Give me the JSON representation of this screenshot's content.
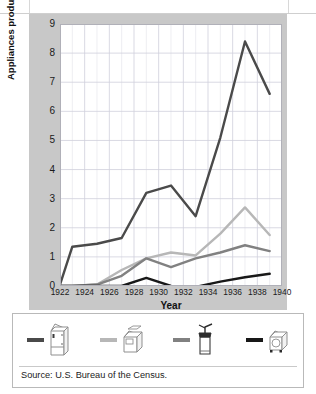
{
  "chart_data": {
    "type": "line",
    "title": "",
    "xlabel": "Year",
    "ylabel": "Appliances produced (in millions)",
    "xlim": [
      1922,
      1940
    ],
    "ylim": [
      0,
      9
    ],
    "xticks": [
      1922,
      1924,
      1926,
      1928,
      1930,
      1932,
      1934,
      1936,
      1938,
      1940
    ],
    "yticks": [
      0,
      1,
      2,
      3,
      4,
      5,
      6,
      7,
      8,
      9
    ],
    "grid": true,
    "legend_position": "bottom",
    "x": [
      1922,
      1923,
      1925,
      1927,
      1929,
      1931,
      1933,
      1935,
      1937,
      1939
    ],
    "series": [
      {
        "name": "refrigerators",
        "icon": "refrigerator-icon",
        "color": "#4a4a4a",
        "values": [
          0.05,
          1.35,
          1.45,
          1.65,
          3.2,
          3.45,
          2.4,
          5.1,
          8.4,
          6.6
        ]
      },
      {
        "name": "washing-machines",
        "icon": "washing-machine-icon",
        "color": "#b7b7b7",
        "values": [
          0.0,
          0.0,
          0.05,
          0.55,
          0.95,
          1.15,
          1.05,
          1.8,
          2.7,
          1.75
        ]
      },
      {
        "name": "vacuum-cleaners",
        "icon": "vacuum-cleaner-icon",
        "color": "#818181",
        "values": [
          0.0,
          0.0,
          0.05,
          0.35,
          0.95,
          0.65,
          0.95,
          1.15,
          1.4,
          1.2
        ]
      },
      {
        "name": "radios",
        "icon": "radio-icon",
        "color": "#181818",
        "values": [
          0.0,
          0.0,
          0.0,
          0.0,
          0.28,
          0.0,
          -0.03,
          0.15,
          0.3,
          0.42
        ]
      }
    ]
  },
  "axis": {
    "y_title": "Appliances produced (in millions)",
    "x_title": "Year",
    "y_labels": [
      "0",
      "1",
      "2",
      "3",
      "4",
      "5",
      "6",
      "7",
      "8",
      "9"
    ],
    "x_labels": [
      "1922",
      "1924",
      "1926",
      "1928",
      "1930",
      "1932",
      "1934",
      "1936",
      "1938",
      "1940"
    ]
  },
  "legend": {
    "items": [
      {
        "icon": "refrigerator-icon",
        "swatch_color": "#4a4a4a"
      },
      {
        "icon": "washing-machine-icon",
        "swatch_color": "#b7b7b7"
      },
      {
        "icon": "vacuum-cleaner-icon",
        "swatch_color": "#818181"
      },
      {
        "icon": "radio-icon",
        "swatch_color": "#181818"
      }
    ]
  },
  "footer": {
    "source": "Source: U.S. Bureau of the Census."
  },
  "colors": {
    "panel_background": "#c8c8c8",
    "plot_background": "#ffffff",
    "grid_minor": "#e3e3ea",
    "grid_major": "#cfcfdc",
    "text": "#1a1a1a"
  }
}
